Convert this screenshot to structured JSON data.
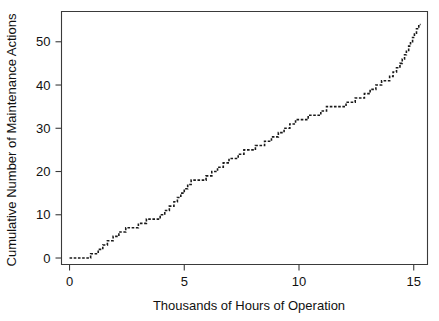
{
  "chart_data": {
    "type": "line",
    "subtype": "cumulative-step-function",
    "title": "",
    "xlabel": "Thousands of Hours of Operation",
    "ylabel": "Cumulative Number of Maintenance Actions",
    "xlim": [
      -0.35,
      15.6
    ],
    "ylim": [
      -1.5,
      57
    ],
    "xticks": [
      0,
      5,
      10,
      15
    ],
    "xtick_labels": [
      "0",
      "5",
      "10",
      "15"
    ],
    "yticks": [
      0,
      10,
      20,
      30,
      40,
      50
    ],
    "ytick_labels": [
      "0",
      "10",
      "20",
      "30",
      "40",
      "50"
    ],
    "grid": false,
    "legend": false,
    "line_style": "dotted",
    "line_color": "#1a1a1a",
    "frame_color": "#3a3a3a",
    "background_color": "#ffffff",
    "series": [
      {
        "name": "Cumulative maintenance actions",
        "x": [
          0.0,
          0.92,
          1.05,
          1.18,
          1.3,
          1.45,
          1.6,
          1.78,
          1.95,
          2.1,
          2.25,
          2.45,
          2.6,
          2.95,
          3.1,
          3.3,
          3.5,
          3.95,
          4.1,
          4.25,
          4.4,
          4.55,
          4.7,
          4.85,
          5.0,
          5.6,
          5.78,
          5.95,
          6.12,
          6.3,
          6.5,
          6.7,
          6.95,
          7.2,
          7.5,
          7.8,
          8.05,
          8.45,
          8.7,
          9.0,
          9.3,
          9.55,
          9.9,
          10.15,
          10.45,
          10.8,
          11.1,
          11.95,
          12.3,
          12.6,
          12.95,
          13.3,
          13.6,
          13.95,
          14.25,
          14.55,
          14.8,
          15.0,
          15.2
        ],
        "y": [
          0,
          1,
          2,
          3,
          4,
          5,
          6,
          7,
          8,
          9,
          10,
          11,
          12,
          13,
          14,
          15,
          16,
          17,
          18,
          19,
          20,
          21,
          22,
          23,
          24,
          25,
          26,
          27,
          28,
          29,
          30,
          31,
          32,
          33,
          34,
          35,
          36,
          37,
          38,
          39,
          40,
          41,
          42,
          43,
          44,
          45,
          46,
          47,
          48,
          49,
          50,
          51,
          52,
          53,
          54,
          55,
          56,
          57,
          58
        ]
      }
    ],
    "steps": [
      {
        "x_start": 0.0,
        "x_end": 0.92,
        "level": 0
      },
      {
        "x_start": 0.92,
        "x_end": 1.25,
        "level": 1
      },
      {
        "x_start": 1.25,
        "x_end": 1.45,
        "level": 2
      },
      {
        "x_start": 1.45,
        "x_end": 1.65,
        "level": 3
      },
      {
        "x_start": 1.65,
        "x_end": 1.9,
        "level": 4
      },
      {
        "x_start": 1.9,
        "x_end": 2.15,
        "level": 5
      },
      {
        "x_start": 2.15,
        "x_end": 2.45,
        "level": 6
      },
      {
        "x_start": 2.45,
        "x_end": 3.0,
        "level": 7
      },
      {
        "x_start": 3.0,
        "x_end": 3.35,
        "level": 8
      },
      {
        "x_start": 3.35,
        "x_end": 3.95,
        "level": 9
      },
      {
        "x_start": 3.95,
        "x_end": 4.15,
        "level": 10
      },
      {
        "x_start": 4.15,
        "x_end": 4.35,
        "level": 11
      },
      {
        "x_start": 4.35,
        "x_end": 4.55,
        "level": 12
      },
      {
        "x_start": 4.55,
        "x_end": 4.7,
        "level": 13
      },
      {
        "x_start": 4.7,
        "x_end": 4.85,
        "level": 14
      },
      {
        "x_start": 4.85,
        "x_end": 5.0,
        "level": 15
      },
      {
        "x_start": 5.0,
        "x_end": 5.15,
        "level": 16
      },
      {
        "x_start": 5.15,
        "x_end": 5.3,
        "level": 17
      },
      {
        "x_start": 5.3,
        "x_end": 5.95,
        "level": 18
      },
      {
        "x_start": 5.95,
        "x_end": 6.2,
        "level": 19
      },
      {
        "x_start": 6.2,
        "x_end": 6.45,
        "level": 20
      },
      {
        "x_start": 6.45,
        "x_end": 6.7,
        "level": 21
      },
      {
        "x_start": 6.7,
        "x_end": 6.95,
        "level": 22
      },
      {
        "x_start": 6.95,
        "x_end": 7.35,
        "level": 23
      },
      {
        "x_start": 7.35,
        "x_end": 7.6,
        "level": 24
      },
      {
        "x_start": 7.6,
        "x_end": 8.1,
        "level": 25
      },
      {
        "x_start": 8.1,
        "x_end": 8.5,
        "level": 26
      },
      {
        "x_start": 8.5,
        "x_end": 8.8,
        "level": 27
      },
      {
        "x_start": 8.8,
        "x_end": 9.1,
        "level": 28
      },
      {
        "x_start": 9.1,
        "x_end": 9.35,
        "level": 29
      },
      {
        "x_start": 9.35,
        "x_end": 9.6,
        "level": 30
      },
      {
        "x_start": 9.6,
        "x_end": 9.85,
        "level": 31
      },
      {
        "x_start": 9.85,
        "x_end": 10.4,
        "level": 32
      },
      {
        "x_start": 10.4,
        "x_end": 10.95,
        "level": 33
      },
      {
        "x_start": 10.95,
        "x_end": 11.2,
        "level": 34
      },
      {
        "x_start": 11.2,
        "x_end": 12.05,
        "level": 35
      },
      {
        "x_start": 12.05,
        "x_end": 12.45,
        "level": 36
      },
      {
        "x_start": 12.45,
        "x_end": 12.85,
        "level": 37
      },
      {
        "x_start": 12.85,
        "x_end": 13.1,
        "level": 38
      },
      {
        "x_start": 13.1,
        "x_end": 13.35,
        "level": 39
      },
      {
        "x_start": 13.35,
        "x_end": 13.6,
        "level": 40
      },
      {
        "x_start": 13.6,
        "x_end": 13.95,
        "level": 41
      },
      {
        "x_start": 13.95,
        "x_end": 14.1,
        "level": 42
      },
      {
        "x_start": 14.1,
        "x_end": 14.25,
        "level": 43
      },
      {
        "x_start": 14.25,
        "x_end": 14.4,
        "level": 44
      },
      {
        "x_start": 14.4,
        "x_end": 14.5,
        "level": 45
      },
      {
        "x_start": 14.5,
        "x_end": 14.6,
        "level": 46
      },
      {
        "x_start": 14.6,
        "x_end": 14.68,
        "level": 47
      },
      {
        "x_start": 14.68,
        "x_end": 14.78,
        "level": 48
      },
      {
        "x_start": 14.78,
        "x_end": 14.86,
        "level": 49
      },
      {
        "x_start": 14.86,
        "x_end": 14.95,
        "level": 50
      },
      {
        "x_start": 14.95,
        "x_end": 15.03,
        "level": 51
      },
      {
        "x_start": 15.03,
        "x_end": 15.12,
        "level": 52
      },
      {
        "x_start": 15.12,
        "x_end": 15.22,
        "level": 53
      },
      {
        "x_start": 15.22,
        "x_end": 15.3,
        "level": 54
      }
    ]
  }
}
